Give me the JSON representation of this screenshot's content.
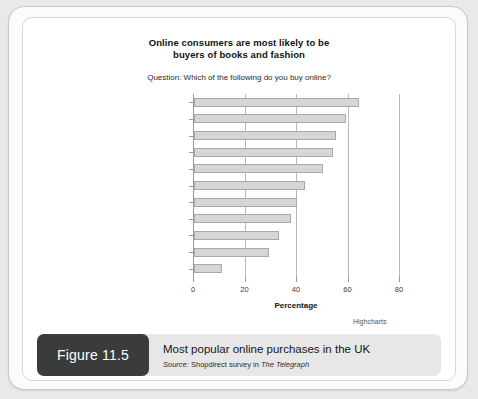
{
  "chart_data": {
    "type": "bar",
    "orientation": "horizontal",
    "title": "Online consumers are most likely to be buyers of books and fashion",
    "title_line1": "Online consumers are most likely to be",
    "title_line2": "buyers of books and fashion",
    "subtitle": "Question: Which of the following do you buy online?",
    "categories": [
      "Books",
      "Clothes and accessories",
      "Music and entertainment",
      "Electronics",
      "Holidays and travel",
      "Tickets",
      "Beauty and healthcare",
      "Food and groceries",
      "Toys and games",
      "Furniture",
      "Other"
    ],
    "values": [
      64,
      59,
      55,
      54,
      50,
      43,
      40,
      37.5,
      33,
      29,
      11
    ],
    "xlabel": "Percentage",
    "ylabel": "",
    "xlim": [
      0,
      80
    ],
    "xticks": [
      0,
      20,
      40,
      60,
      80
    ],
    "xtick_labels": [
      "0",
      "20",
      "40",
      "60",
      "80"
    ],
    "grid": true,
    "legend": false,
    "credit": "Highcharts",
    "bar_fill": "#d6d6d6",
    "bar_stroke": "#a9a9a9"
  },
  "caption": {
    "figure_tag": "Figure 11.5",
    "title": "Most popular online purchases in the UK",
    "source_label": "Source:",
    "source_body": "Shopdirect survey in",
    "source_publication": "The Telegraph"
  }
}
